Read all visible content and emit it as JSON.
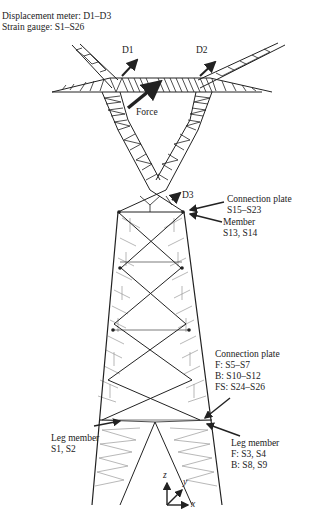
{
  "legend": {
    "line1": "Displacement meter: D1–D3",
    "line2": "Strain gauge: S1–S26"
  },
  "markers": {
    "d1": "D1",
    "d2": "D2",
    "d3": "D3",
    "force": "Force"
  },
  "annotations": {
    "upper_plate": {
      "title": "Connection plate",
      "gauges": "S15–S23"
    },
    "upper_member": {
      "title": "Member",
      "gauges": "S13, S14"
    },
    "lower_plate": {
      "title": "Connection plate",
      "f": "F: S5–S7",
      "b": "B: S10–S12",
      "fs": "FS: S24–S26"
    },
    "leg_right": {
      "title": "Leg member",
      "f": "F: S3, S4",
      "b": "B: S8, S9"
    },
    "leg_left": {
      "title": "Leg member",
      "gauges": "S1, S2"
    }
  },
  "axes": {
    "z": "z",
    "y": "y",
    "x": "x"
  },
  "colors": {
    "ink": "#222222",
    "light_member": "#9a9a9a",
    "background": "#ffffff"
  }
}
